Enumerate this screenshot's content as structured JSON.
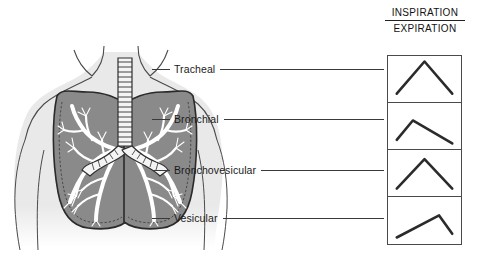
{
  "figure": {
    "title_absent": true,
    "background_color": "#ffffff",
    "ink_color": "#1a1a1a",
    "lung_fill": "#8a8a8a",
    "lung_outline": "#2a2a2a",
    "body_fill": "#e9e9e9",
    "body_outline": "#4a4a4a",
    "airway_fill": "#ffffff"
  },
  "header": {
    "inspiration": "INSPIRATION",
    "expiration": "EXPIRATION"
  },
  "labels": [
    {
      "name": "Tracheal"
    },
    {
      "name": "Bronchial"
    },
    {
      "name": "Bronchovesicular"
    },
    {
      "name": "Vesicular"
    }
  ],
  "chart_data": {
    "type": "line",
    "xlabel": "",
    "ylabel": "",
    "legend": [
      "INSPIRATION",
      "EXPIRATION"
    ],
    "series": [
      {
        "name": "Tracheal",
        "inspiration_relative_duration": 0.5,
        "expiration_relative_duration": 0.5,
        "peak_x_fraction": 0.5,
        "amplitude": 1.0,
        "points": [
          [
            0.12,
            0.18
          ],
          [
            0.5,
            0.88
          ],
          [
            0.88,
            0.18
          ]
        ]
      },
      {
        "name": "Bronchial",
        "inspiration_relative_duration": 0.3,
        "expiration_relative_duration": 0.7,
        "peak_x_fraction": 0.34,
        "amplitude": 0.62,
        "points": [
          [
            0.12,
            0.2
          ],
          [
            0.34,
            0.62
          ],
          [
            0.88,
            0.12
          ]
        ]
      },
      {
        "name": "Bronchovesicular",
        "inspiration_relative_duration": 0.5,
        "expiration_relative_duration": 0.5,
        "peak_x_fraction": 0.5,
        "amplitude": 0.88,
        "points": [
          [
            0.12,
            0.16
          ],
          [
            0.5,
            0.8
          ],
          [
            0.88,
            0.16
          ]
        ]
      },
      {
        "name": "Vesicular",
        "inspiration_relative_duration": 0.72,
        "expiration_relative_duration": 0.28,
        "peak_x_fraction": 0.7,
        "amplitude": 0.58,
        "points": [
          [
            0.12,
            0.12
          ],
          [
            0.7,
            0.6
          ],
          [
            0.88,
            0.2
          ]
        ]
      }
    ]
  },
  "anatomy": {
    "parts": [
      "torso-outline",
      "neck",
      "shoulders",
      "trachea",
      "carina",
      "left-main-bronchus",
      "right-main-bronchus",
      "bronchial-tree",
      "left-lung",
      "right-lung"
    ]
  }
}
